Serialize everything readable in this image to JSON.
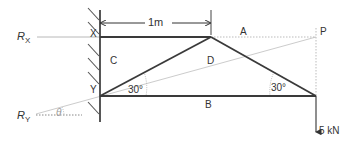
{
  "diagram": {
    "type": "truss-free-body",
    "dimension": {
      "label": "1m"
    },
    "reactions": {
      "rx": {
        "symbol": "R",
        "subscript": "X"
      },
      "ry": {
        "symbol": "R",
        "subscript": "Y"
      },
      "angle": "θ"
    },
    "joints": {
      "x": "X",
      "y": "Y",
      "p": "P"
    },
    "regions": {
      "a": "A",
      "b": "B",
      "c": "C",
      "d": "D"
    },
    "angles": {
      "left": "30°",
      "right": "30°"
    },
    "load": {
      "label": "5 kN"
    },
    "colors": {
      "member": "#3a3a3a",
      "construction": "#b8b8b8",
      "text": "#333333"
    }
  }
}
